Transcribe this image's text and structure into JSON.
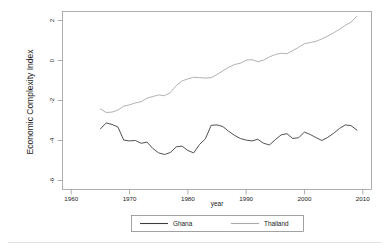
{
  "chart_data": {
    "type": "line",
    "title": "",
    "xlabel": "year",
    "ylabel": "Economic Complexity Index",
    "xlim": [
      1958.5,
      2011.5
    ],
    "ylim": [
      -6.45,
      2.45
    ],
    "xticks": [
      1960,
      1970,
      1980,
      1990,
      2000,
      2010
    ],
    "yticks": [
      2,
      0,
      -2,
      -4,
      -6
    ],
    "xtick_labels": [
      "1960",
      "1970",
      "1980",
      "1990",
      "2000",
      "2010"
    ],
    "ytick_labels": [
      "2",
      "0",
      "-2",
      "-4",
      "-6"
    ],
    "grid": false,
    "legend_position": "bottom",
    "series": [
      {
        "name": "Ghana",
        "color": "#3d3d3d",
        "x": [
          1965,
          1966,
          1967,
          1968,
          1969,
          1970,
          1971,
          1972,
          1973,
          1974,
          1975,
          1976,
          1977,
          1978,
          1979,
          1980,
          1981,
          1982,
          1983,
          1984,
          1985,
          1986,
          1987,
          1988,
          1989,
          1990,
          1991,
          1992,
          1993,
          1994,
          1995,
          1996,
          1997,
          1998,
          1999,
          2000,
          2001,
          2002,
          2003,
          2004,
          2005,
          2006,
          2007,
          2008,
          2009
        ],
        "values": [
          -3.42,
          -3.12,
          -3.2,
          -3.32,
          -3.98,
          -4.02,
          -4.0,
          -4.14,
          -4.08,
          -4.4,
          -4.62,
          -4.7,
          -4.6,
          -4.32,
          -4.28,
          -4.5,
          -4.62,
          -4.2,
          -3.92,
          -3.24,
          -3.22,
          -3.3,
          -3.54,
          -3.74,
          -3.9,
          -3.98,
          -4.02,
          -3.94,
          -4.14,
          -4.22,
          -3.96,
          -3.72,
          -3.66,
          -3.9,
          -3.86,
          -3.58,
          -3.7,
          -3.86,
          -4.0,
          -3.84,
          -3.64,
          -3.4,
          -3.22,
          -3.26,
          -3.48
        ]
      },
      {
        "name": "Thailand",
        "color": "#a8a8a8",
        "x": [
          1965,
          1966,
          1967,
          1968,
          1969,
          1970,
          1971,
          1972,
          1973,
          1974,
          1975,
          1976,
          1977,
          1978,
          1979,
          1980,
          1981,
          1982,
          1983,
          1984,
          1985,
          1986,
          1987,
          1988,
          1989,
          1990,
          1991,
          1992,
          1993,
          1994,
          1995,
          1996,
          1997,
          1998,
          1999,
          2000,
          2001,
          2002,
          2003,
          2004,
          2005,
          2006,
          2007,
          2008,
          2009
        ],
        "values": [
          -2.42,
          -2.6,
          -2.58,
          -2.48,
          -2.28,
          -2.22,
          -2.12,
          -2.06,
          -1.88,
          -1.8,
          -1.72,
          -1.76,
          -1.6,
          -1.26,
          -1.02,
          -0.92,
          -0.84,
          -0.86,
          -0.88,
          -0.86,
          -0.7,
          -0.52,
          -0.34,
          -0.2,
          -0.14,
          0.02,
          0.04,
          -0.06,
          0.02,
          0.18,
          0.3,
          0.36,
          0.34,
          0.5,
          0.66,
          0.84,
          0.9,
          0.96,
          1.08,
          1.22,
          1.38,
          1.56,
          1.76,
          1.92,
          2.22
        ]
      }
    ]
  },
  "legend": {
    "entries": [
      {
        "label": "Ghana"
      },
      {
        "label": "Thailand"
      }
    ]
  }
}
